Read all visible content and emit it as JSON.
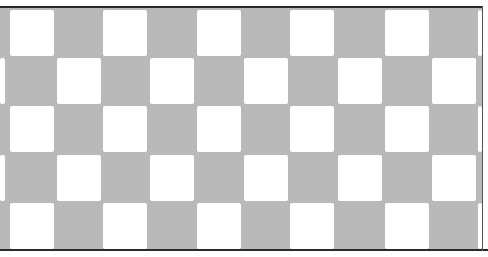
{
  "image": {
    "description": "Scanned photograph of a checkerboard pattern of white squares on a gray field",
    "colors": {
      "field": "#b9b9b9",
      "square": "#ffffff",
      "frame_line": "#2a2a2a"
    },
    "grid": {
      "rows": 5,
      "row_tops": [
        10,
        58,
        106,
        155,
        203
      ],
      "square_height": 46,
      "square_width": 44,
      "even_row_lefts": [
        10,
        103,
        197,
        290,
        385,
        478
      ],
      "odd_row_lefts": [
        57,
        150,
        244,
        338,
        432,
        0
      ]
    }
  }
}
